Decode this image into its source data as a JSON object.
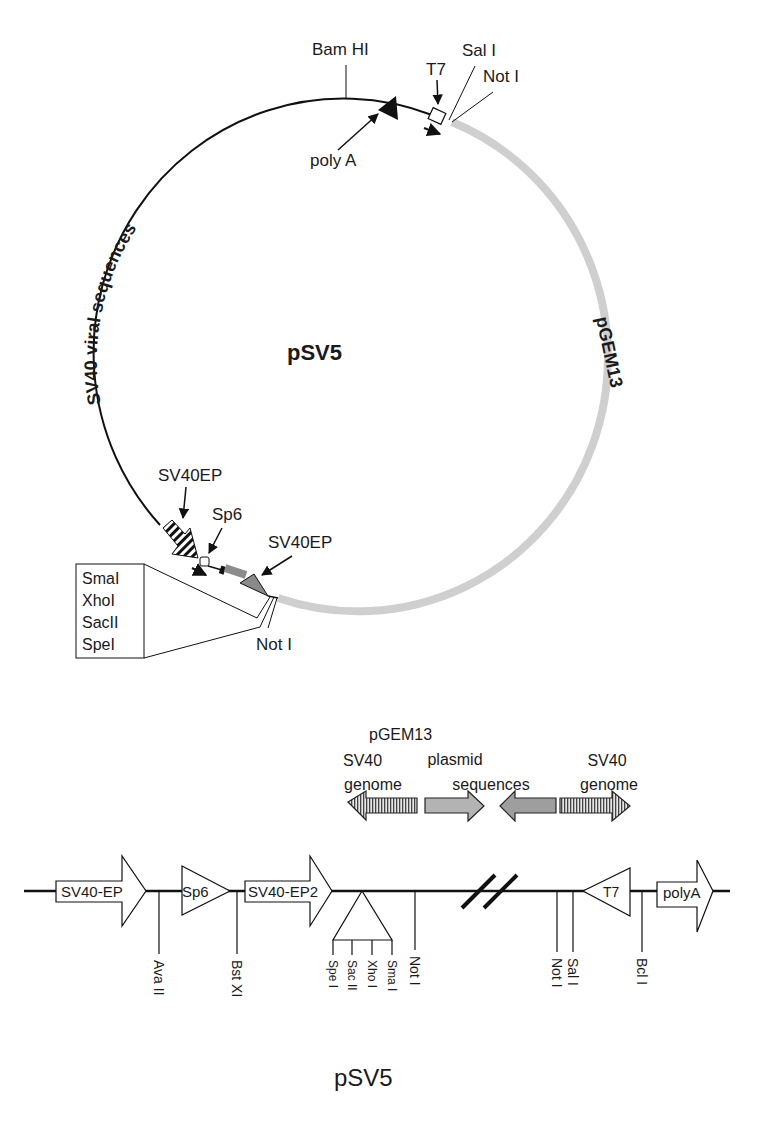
{
  "plasmid_map": {
    "name": "pSV5",
    "segments": [
      {
        "label": "SV40 viral sequences",
        "style": "black-line"
      },
      {
        "label": "pGEM13",
        "style": "gray-thick"
      }
    ],
    "features": {
      "bamhi": "Bam HI",
      "t7": "T7",
      "sali": "Sal I",
      "noti_top": "Not I",
      "polya": "poly A",
      "sv40ep1": "SV40EP",
      "sp6": "Sp6",
      "sv40ep2": "SV40EP",
      "noti_bottom": "Not I"
    },
    "mcs_box": [
      "SmaI",
      "XhoI",
      "SacII",
      "SpeI"
    ]
  },
  "legend_arrows": {
    "sv40_left": {
      "line1": "SV40",
      "line2": "genome"
    },
    "pgem": {
      "line1": "pGEM13",
      "line2": "plasmid",
      "line3": "sequences"
    },
    "sv40_right": {
      "line1": "SV40",
      "line2": "genome"
    }
  },
  "linear_map": {
    "elements": {
      "sv40ep": "SV40-EP",
      "sp6": "Sp6",
      "sv40ep2": "SV40-EP2",
      "t7": "T7",
      "polya": "polyA"
    },
    "sites": {
      "avaii": "Ava II",
      "bstxi": "Bst XI",
      "spei": "Spe I",
      "sacii": "Sac II",
      "xhoi": "Xho I",
      "smai": "Sma I",
      "noti1": "Not I",
      "noti2": "Not I",
      "sali": "Sal I",
      "bcli": "Bcl I"
    },
    "title": "pSV5"
  }
}
